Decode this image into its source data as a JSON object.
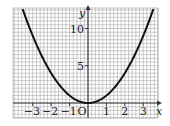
{
  "chart_data": {
    "type": "line",
    "title": "",
    "xlabel": "x",
    "ylabel": "y",
    "origin_label": "O",
    "xlim": [
      -4.1,
      3.8
    ],
    "ylim": [
      -2,
      12.5
    ],
    "grid": true,
    "x_ticks": [
      {
        "v": -3,
        "label": "−3"
      },
      {
        "v": -2,
        "label": "−2"
      },
      {
        "v": -1,
        "label": "−1"
      },
      {
        "v": 1,
        "label": "1"
      },
      {
        "v": 2,
        "label": "2"
      },
      {
        "v": 3,
        "label": "3"
      }
    ],
    "y_ticks": [
      {
        "v": 5,
        "label": "5"
      },
      {
        "v": 10,
        "label": "10"
      }
    ],
    "series": [
      {
        "name": "y = x²",
        "function": "x^2",
        "x": [
          -3.6,
          -3,
          -2,
          -1,
          0,
          1,
          2,
          3,
          3.6
        ],
        "values": [
          12.96,
          9,
          4,
          1,
          0,
          1,
          4,
          9,
          12.96
        ]
      }
    ],
    "colors": {
      "grid": "#9a9a9a",
      "axis": "#333333",
      "curve": "#111111"
    }
  }
}
